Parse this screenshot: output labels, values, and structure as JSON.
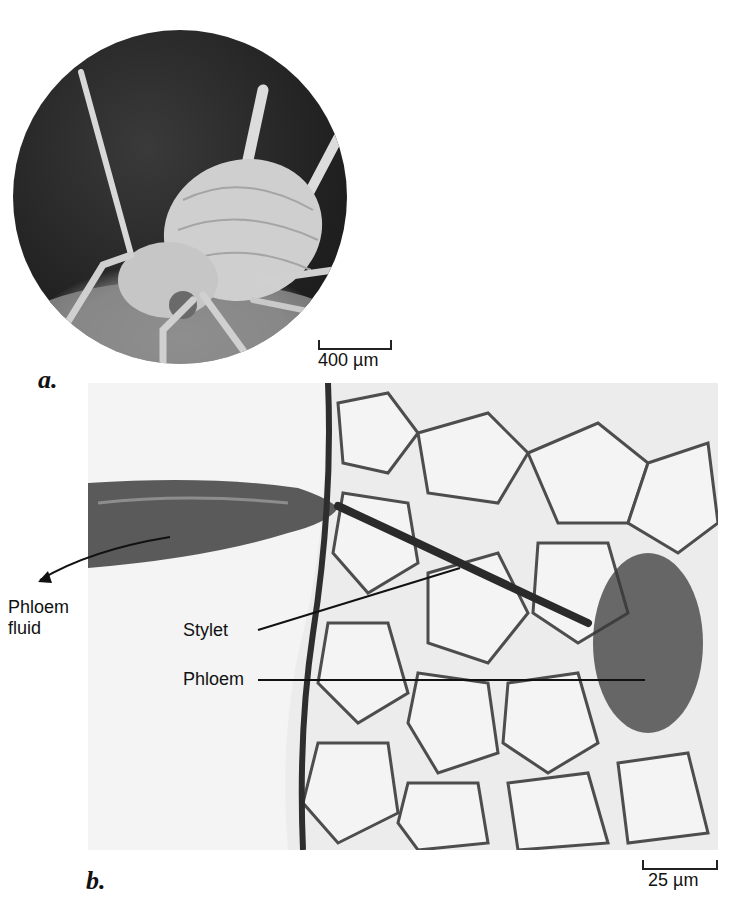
{
  "figure": {
    "panel_a": {
      "letter": "a.",
      "image_description": "Scanning electron micrograph of an aphid standing on a leaf surface, shown in a circular frame",
      "scale_bar": {
        "label": "400 µm"
      }
    },
    "panel_b": {
      "letter": "b.",
      "image_description": "Light micrograph of detached aphid mouthpart with stylet penetrating plant cells to reach phloem",
      "scale_bar": {
        "label": "25 µm"
      },
      "labels": {
        "phloem_fluid_line1": "Phloem",
        "phloem_fluid_line2": "fluid",
        "stylet": "Stylet",
        "phloem": "Phloem"
      }
    }
  }
}
